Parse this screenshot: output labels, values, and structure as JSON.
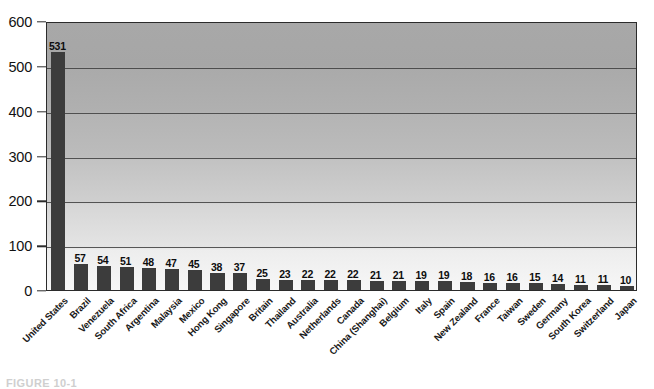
{
  "chart_data": {
    "type": "bar",
    "title": "",
    "xlabel": "",
    "ylabel": "",
    "ylim": [
      0,
      600
    ],
    "yticks": [
      0,
      100,
      200,
      300,
      400,
      500,
      600
    ],
    "grid": true,
    "legend": false,
    "orientation": "vertical",
    "categories": [
      "United States",
      "Brazil",
      "Venezuela",
      "South Africa",
      "Argentina",
      "Malaysia",
      "Mexico",
      "Hong Kong",
      "Singapore",
      "Britain",
      "Thailand",
      "Australia",
      "Netherlands",
      "Canada",
      "China (Shanghai)",
      "Belgium",
      "Italy",
      "Spain",
      "New Zealand",
      "France",
      "Taiwan",
      "Sweden",
      "Germany",
      "South Korea",
      "Switzerland",
      "Japan"
    ],
    "values": [
      531,
      57,
      54,
      51,
      48,
      47,
      45,
      38,
      37,
      25,
      23,
      22,
      22,
      22,
      21,
      21,
      19,
      19,
      18,
      16,
      16,
      15,
      14,
      11,
      11,
      10
    ],
    "datalabels": [
      "531",
      "57",
      "54",
      "51",
      "48",
      "47",
      "45",
      "38",
      "37",
      "25",
      "23",
      "22",
      "22",
      "22",
      "21",
      "21",
      "19",
      "19",
      "18",
      "16",
      "16",
      "15",
      "14",
      "11",
      "11",
      "10"
    ],
    "colors": {
      "bar": "#3c3c3c",
      "axis": "#2b2b2b",
      "gridline": "#3d3d3d",
      "plot_background_top": "#a8a8a8",
      "plot_background_bottom": "#f7f7f7",
      "text": "#111111",
      "page_background": "#ffffff"
    }
  },
  "caption": {
    "text": "FIGURE 10-1"
  }
}
